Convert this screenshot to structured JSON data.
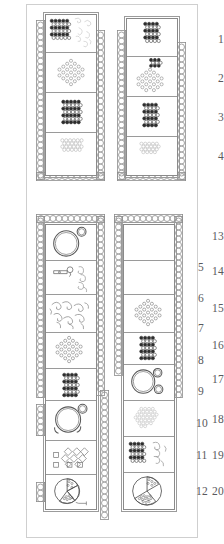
{
  "figure": {
    "title": "",
    "background_color": "#ffffff",
    "frame_color": "#cfcfcf",
    "ink_color": "#4a4a4a",
    "label_color": "#59595c"
  },
  "labels": {
    "left_top": [
      "1",
      "2",
      "3",
      "4"
    ],
    "left_bottom": [
      "13",
      "14",
      "15",
      "16",
      "17",
      "18",
      "19",
      "20"
    ],
    "right_bottom": [
      "5",
      "6",
      "7",
      "8",
      "9",
      "10",
      "11",
      "12"
    ]
  },
  "columns": [
    {
      "id": "top-left-column",
      "label_side": "left",
      "labels": [
        "1",
        "2",
        "3",
        "4"
      ],
      "chain_left": true,
      "chain_right": true,
      "chain_bottom": true,
      "cells": [
        {
          "label": "1",
          "motifs": [
            "dense-beadwork-rectangle",
            "scroll-wire-spirals"
          ]
        },
        {
          "label": "2",
          "motifs": [
            "diamond-lattice-beadwork"
          ]
        },
        {
          "label": "3",
          "motifs": [
            "dense-beadwork-rectangle"
          ]
        },
        {
          "label": "4",
          "motifs": [
            "light-beadwork-band"
          ]
        }
      ]
    },
    {
      "id": "top-right-column",
      "label_side": "none",
      "labels": [],
      "chain_left": true,
      "chain_right": true,
      "chain_bottom": true,
      "cells": [
        {
          "label": "",
          "motifs": [
            "dense-beadwork-rectangle"
          ]
        },
        {
          "label": "",
          "motifs": [
            "dense-beadwork-rectangle",
            "diamond-lattice-beadwork"
          ]
        },
        {
          "label": "",
          "motifs": [
            "dense-beadwork-rectangle"
          ]
        },
        {
          "label": "",
          "motifs": [
            "light-beadwork-band"
          ]
        }
      ]
    },
    {
      "id": "bottom-left-column",
      "label_side": "left",
      "labels": [
        "13",
        "14",
        "15",
        "16",
        "17",
        "18",
        "19",
        "20"
      ],
      "chain_left": true,
      "chain_right": true,
      "chain_top": true,
      "cells": [
        {
          "label": "13",
          "motifs": [
            "large-ring",
            "small-ring"
          ]
        },
        {
          "label": "14",
          "motifs": [
            "pin-brooch",
            "spiral-chain"
          ]
        },
        {
          "label": "15",
          "motifs": [
            "scroll-wire-spirals"
          ]
        },
        {
          "label": "16",
          "motifs": [
            "diamond-lattice-beadwork"
          ]
        },
        {
          "label": "17",
          "motifs": [
            "dense-beadwork-rectangle"
          ]
        },
        {
          "label": "18",
          "motifs": [
            "large-ring",
            "small-ring",
            "crescent-fragments"
          ]
        },
        {
          "label": "19",
          "motifs": [
            "bead-and-square-row"
          ]
        },
        {
          "label": "20",
          "motifs": [
            "hatched-disc",
            "small-pin"
          ]
        }
      ]
    },
    {
      "id": "bottom-right-column",
      "label_side": "right",
      "labels": [
        "5",
        "6",
        "7",
        "8",
        "9",
        "10",
        "11",
        "12"
      ],
      "chain_left": true,
      "chain_right": true,
      "chain_top": true,
      "cells": [
        {
          "label": "5",
          "motifs": []
        },
        {
          "label": "6",
          "motifs": []
        },
        {
          "label": "7",
          "motifs": [
            "diamond-lattice-beadwork"
          ]
        },
        {
          "label": "8",
          "motifs": [
            "dense-beadwork-rectangle"
          ]
        },
        {
          "label": "9",
          "motifs": [
            "large-ring",
            "small-ring"
          ]
        },
        {
          "label": "10",
          "motifs": [
            "light-beadwork-cluster"
          ]
        },
        {
          "label": "11",
          "motifs": [
            "dense-beadwork-rectangle",
            "spiral-chain"
          ]
        },
        {
          "label": "12",
          "motifs": [
            "hatched-disc"
          ]
        }
      ]
    }
  ]
}
